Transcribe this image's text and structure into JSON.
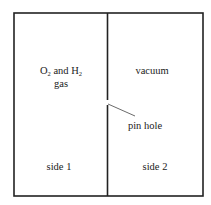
{
  "diagram": {
    "container": {
      "border_color": "#222222"
    },
    "side1": {
      "gas_label": {
        "part1": "O",
        "sub1": "2",
        "part2": " and H",
        "sub2": "2"
      },
      "gas_label_line2": "gas",
      "side_label": "side 1"
    },
    "side2": {
      "content_label": "vacuum",
      "side_label": "side 2"
    },
    "pinhole": {
      "label": "pin hole"
    }
  }
}
